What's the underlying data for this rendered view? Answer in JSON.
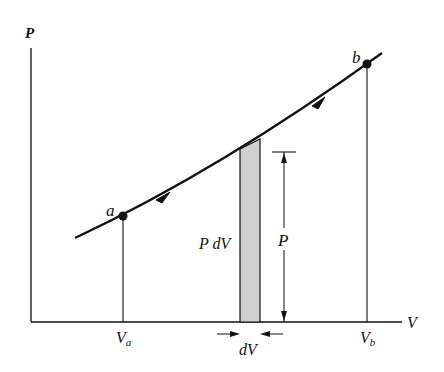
{
  "diagram": {
    "type": "PV diagram",
    "axes": {
      "y_label": "P",
      "x_label": "V"
    },
    "points": [
      {
        "name": "a",
        "label": "a",
        "x": 123,
        "y": 216
      },
      {
        "name": "b",
        "label": "b",
        "x": 367,
        "y": 64
      }
    ],
    "tick_labels": {
      "va": {
        "main": "V",
        "sub": "a"
      },
      "vb": {
        "main": "V",
        "sub": "b"
      }
    },
    "strip": {
      "label": "P dV",
      "fill": "#cfcfcf"
    },
    "dimension": {
      "height_label": "P",
      "width_label": "dV"
    },
    "colors": {
      "line": "#111111",
      "strip_fill": "#cfcfcf",
      "background": "#ffffff"
    }
  }
}
